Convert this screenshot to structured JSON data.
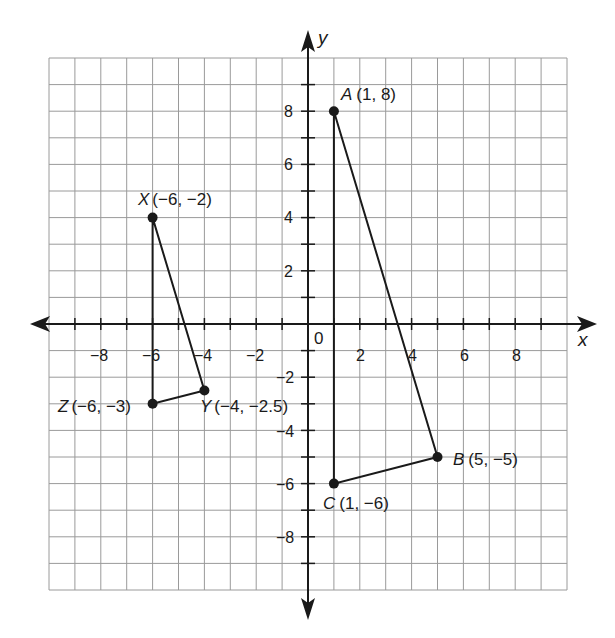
{
  "diagram": {
    "type": "coordinate-plane",
    "axes": {
      "x_label": "x",
      "y_label": "y",
      "origin_label": "0",
      "x_range": [
        -10,
        10
      ],
      "y_range": [
        -10,
        10
      ],
      "x_tick_labels": [
        "-8",
        "-6",
        "-4",
        "-2",
        "2",
        "4",
        "6",
        "8"
      ],
      "y_tick_labels": [
        "8",
        "6",
        "4",
        "2",
        "-2",
        "-4",
        "-6",
        "-8"
      ],
      "grid": true
    },
    "colors": {
      "grid": "#9a9a9a",
      "axis": "#1a1a1a",
      "shape": "#1a1a1a",
      "background": "#ffffff"
    },
    "triangles": [
      {
        "name": "ABC",
        "points": [
          {
            "name": "A",
            "x": 1,
            "y": 8,
            "label": "A",
            "coords": "(1, 8)"
          },
          {
            "name": "B",
            "x": 5,
            "y": -5,
            "label": "B",
            "coords": "(5, −5)"
          },
          {
            "name": "C",
            "x": 1,
            "y": -6,
            "label": "C",
            "coords": "(1, −6)"
          }
        ]
      },
      {
        "name": "XYZ",
        "points": [
          {
            "name": "X",
            "x": -6,
            "y": 4,
            "label": "X",
            "coords": "(−6, −2)"
          },
          {
            "name": "Y",
            "x": -4,
            "y": -2.5,
            "label": "Y",
            "coords": "(−4, −2.5)"
          },
          {
            "name": "Z",
            "x": -6,
            "y": -3,
            "label": "Z",
            "coords": "(−6, −3)"
          }
        ]
      }
    ]
  },
  "labels": {
    "x_axis": "x",
    "y_axis": "y",
    "origin": "0",
    "x_ticks": {
      "m8": "−8",
      "m6": "−6",
      "m4": "−4",
      "m2": "−2",
      "p2": "2",
      "p4": "4",
      "p6": "6",
      "p8": "8"
    },
    "y_ticks": {
      "p8": "8",
      "p6": "6",
      "p4": "4",
      "p2": "2",
      "m2": "−2",
      "m4": "−4",
      "m6": "−6",
      "m8": "−8"
    },
    "A": "A (1, 8)",
    "B": "B (5, −5)",
    "C": "C (1, −6)",
    "X": "X (−6, −2)",
    "Y": "Y (−4, −2.5)",
    "Z": "Z (−6, −3)"
  }
}
